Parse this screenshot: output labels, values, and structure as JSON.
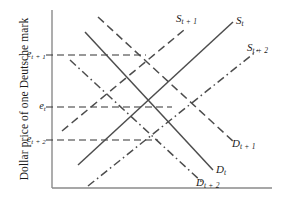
{
  "figure": {
    "background": "#ffffff",
    "line_color": "#4d4d4d",
    "axis_color": "#8a8a8a"
  },
  "axes": {
    "y_axis_title": "Dollar price of one Deutsche mark",
    "x_axis_title": "",
    "y_ticks": [
      {
        "id": "e_t_plus_1",
        "base": "e",
        "sub": "t + 1",
        "y_px": 55
      },
      {
        "id": "e_t",
        "base": "e",
        "sub": "t",
        "y_px": 107
      },
      {
        "id": "e_t_plus_2",
        "base": "e",
        "sub": "t + 2",
        "y_px": 140
      }
    ],
    "origin": {
      "x_px": 52,
      "y_px": 188
    },
    "y_axis_top_px": 10,
    "x_axis_right_px": 272
  },
  "chart_data": {
    "type": "line",
    "title": "",
    "xlabel": "",
    "ylabel": "Dollar price of one Deutsche mark",
    "grid": false,
    "legend": "inline-curve-labels",
    "xlim": [
      52,
      272
    ],
    "ylim_px": [
      10,
      188
    ],
    "annotations": [
      {
        "label": "e",
        "sub": "t + 1",
        "type": "equilibrium-level",
        "value_px_y": 55
      },
      {
        "label": "e",
        "sub": "t",
        "type": "equilibrium-level",
        "value_px_y": 107
      },
      {
        "label": "e",
        "sub": "t + 2",
        "type": "equilibrium-level",
        "value_px_y": 140
      }
    ],
    "series": [
      {
        "name": "S_t",
        "label_base": "S",
        "label_sub": "t",
        "kind": "supply",
        "style": "solid",
        "slope": "upward",
        "points": [
          [
            78,
            165
          ],
          [
            233,
            22
          ]
        ],
        "label_px": {
          "x": 236,
          "y": 14
        }
      },
      {
        "name": "S_t+1",
        "label_base": "S",
        "label_sub": "t + 1",
        "kind": "supply",
        "style": "dashed",
        "slope": "upward",
        "points": [
          [
            62,
            131
          ],
          [
            184,
            30
          ]
        ],
        "label_px": {
          "x": 176,
          "y": 12
        }
      },
      {
        "name": "S_t+2",
        "label_base": "S",
        "label_sub": "t + 2",
        "kind": "supply",
        "style": "dashdot",
        "slope": "upward",
        "points": [
          [
            88,
            186
          ],
          [
            258,
            50
          ]
        ],
        "label_px": {
          "x": 247,
          "y": 41
        }
      },
      {
        "name": "D_t",
        "label_base": "D",
        "label_sub": "t",
        "kind": "demand",
        "style": "solid",
        "slope": "downward",
        "points": [
          [
            85,
            32
          ],
          [
            213,
            170
          ]
        ],
        "label_px": {
          "x": 216,
          "y": 163
        }
      },
      {
        "name": "D_t+1",
        "label_base": "D",
        "label_sub": "t + 1",
        "kind": "demand",
        "style": "dashed",
        "slope": "downward",
        "points": [
          [
            98,
            17
          ],
          [
            235,
            143
          ]
        ],
        "label_px": {
          "x": 232,
          "y": 137
        }
      },
      {
        "name": "D_t+2",
        "label_base": "D",
        "label_sub": "t + 2",
        "kind": "demand",
        "style": "dashdot",
        "slope": "downward",
        "points": [
          [
            70,
            60
          ],
          [
            203,
            183
          ]
        ],
        "label_px": {
          "x": 196,
          "y": 176
        }
      }
    ]
  }
}
